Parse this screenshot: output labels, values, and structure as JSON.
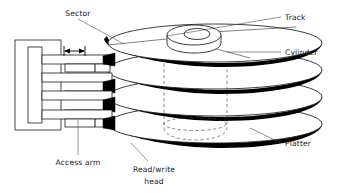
{
  "figure": {
    "background_color": "#ffffff",
    "ink_color": "#000000",
    "label_color": "#1a1a1a"
  },
  "labels": {
    "sector": "Sector",
    "track": "Track",
    "cylinder": "Cylinder",
    "platter": "Platter",
    "access_arm": "Access arm",
    "read_write_head_line1": "Read/write",
    "read_write_head_line2": "head"
  },
  "components": {
    "platter_count": 4,
    "access_arm_count": 4,
    "head_count": 4,
    "spindle_hub": "spindle-hub",
    "motion_arrow": "bidirectional-arrow"
  }
}
